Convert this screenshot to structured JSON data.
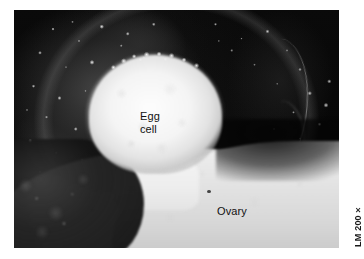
{
  "figure": {
    "type": "light-micrograph",
    "background_color": "#ffffff"
  },
  "photo": {
    "alt_description": "Black and white light micrograph showing a bright round egg cell surrounded by dark speckled follicle tissue, sitting atop a pale ovary mass",
    "frame": {
      "x": 14,
      "y": 10,
      "width": 325,
      "height": 238
    },
    "dominant_colors": {
      "dark_field": "#070707",
      "egg_cell": "#f6f6f6",
      "ovary_tissue": "#e7e7e7",
      "label_text": "#111111"
    }
  },
  "labels": {
    "egg_cell": "Egg\ncell",
    "ovary": "Ovary"
  },
  "caption": {
    "magnification": "LM 200×"
  }
}
